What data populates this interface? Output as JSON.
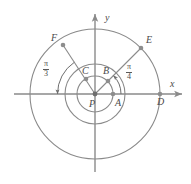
{
  "figure": {
    "background_color": "#ffffff",
    "stroke_color": "#808080",
    "label_color": "#4a4a4a",
    "width": 191,
    "height": 184
  },
  "axes": {
    "x_label": "x",
    "y_label": "y",
    "origin": {
      "x": 95,
      "y": 94
    },
    "x_axis": {
      "x1": 14,
      "y1": 94,
      "x2": 184,
      "y2": 94
    },
    "y_axis": {
      "x1": 95,
      "y1": 172,
      "x2": 95,
      "y2": 12
    }
  },
  "circles": [
    {
      "name": "inner-circle",
      "cx": 95,
      "cy": 94,
      "r": 18
    },
    {
      "name": "middle-circle",
      "cx": 95,
      "cy": 94,
      "r": 30
    },
    {
      "name": "outer-circle",
      "cx": 95,
      "cy": 94,
      "r": 65
    }
  ],
  "points": [
    {
      "label": "P",
      "x": 95,
      "y": 94,
      "lx": 89,
      "ly": 98,
      "circle": "origin"
    },
    {
      "label": "A",
      "x": 113,
      "y": 94,
      "lx": 114,
      "ly": 97,
      "circle": "middle"
    },
    {
      "label": "B",
      "x": 108,
      "y": 81,
      "lx": 103,
      "ly": 66,
      "circle": "inner"
    },
    {
      "label": "C",
      "x": 86,
      "y": 79,
      "lx": 82,
      "ly": 66,
      "circle": "inner"
    },
    {
      "label": "D",
      "x": 160,
      "y": 94,
      "lx": 158,
      "ly": 98,
      "circle": "outer"
    },
    {
      "label": "E",
      "x": 141,
      "y": 48,
      "lx": 145,
      "ly": 37,
      "circle": "outer"
    },
    {
      "label": "F",
      "x": 63,
      "y": 45,
      "lx": 52,
      "ly": 35,
      "circle": "outer"
    }
  ],
  "rays": [
    {
      "name": "ray-P-to-E",
      "x1": 95,
      "y1": 94,
      "x2": 141,
      "y2": 48
    },
    {
      "name": "ray-P-to-F",
      "x1": 95,
      "y1": 94,
      "x2": 63,
      "y2": 45
    }
  ],
  "angle_arcs": [
    {
      "name": "angle-pi-over-3",
      "numerator": "π",
      "denominator": "3",
      "label_x": 46,
      "label_y": 64,
      "radius": 38,
      "from_deg": 123,
      "to_deg": 180,
      "arrow_at": "180"
    },
    {
      "name": "angle-pi-over-4",
      "numerator": "π",
      "denominator": "4",
      "label_x": 128,
      "label_y": 67,
      "radius": 26,
      "from_deg": 0,
      "to_deg": 45,
      "arrow_at": "45"
    }
  ]
}
